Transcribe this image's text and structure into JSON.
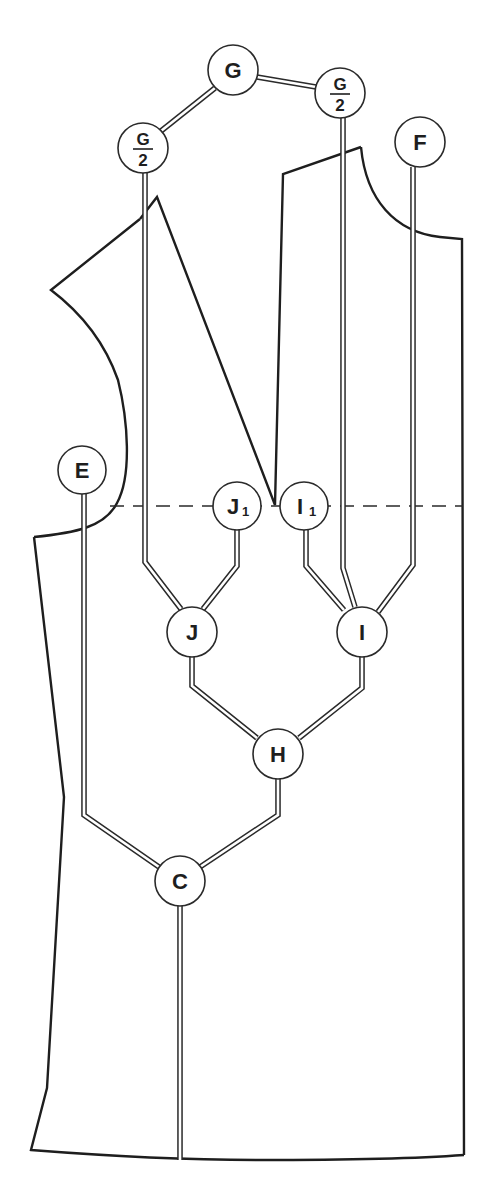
{
  "diagram": {
    "type": "garment-pattern-measurement-tree",
    "stroke_color": "#1e1e1e",
    "background": "#ffffff",
    "nodes": [
      {
        "id": "G",
        "label": "G",
        "sub": "",
        "fraction": false,
        "cx": 233,
        "cy": 70,
        "r": 25
      },
      {
        "id": "G2L",
        "label": "G",
        "sub": "2",
        "fraction": true,
        "cx": 143,
        "cy": 148,
        "r": 25
      },
      {
        "id": "G2R",
        "label": "G",
        "sub": "2",
        "fraction": true,
        "cx": 340,
        "cy": 93,
        "r": 25
      },
      {
        "id": "F",
        "label": "F",
        "sub": "",
        "fraction": false,
        "cx": 420,
        "cy": 142,
        "r": 25
      },
      {
        "id": "E",
        "label": "E",
        "sub": "",
        "fraction": false,
        "cx": 82,
        "cy": 470,
        "r": 24
      },
      {
        "id": "J1",
        "label": "J",
        "sub": "1",
        "fraction": false,
        "cx": 237,
        "cy": 506,
        "r": 24
      },
      {
        "id": "I1",
        "label": "I",
        "sub": "1",
        "fraction": false,
        "cx": 304,
        "cy": 506,
        "r": 24
      },
      {
        "id": "J",
        "label": "J",
        "sub": "",
        "fraction": false,
        "cx": 192,
        "cy": 632,
        "r": 25
      },
      {
        "id": "I",
        "label": "I",
        "sub": "",
        "fraction": false,
        "cx": 362,
        "cy": 632,
        "r": 25
      },
      {
        "id": "H",
        "label": "H",
        "sub": "",
        "fraction": false,
        "cx": 278,
        "cy": 754,
        "r": 25
      },
      {
        "id": "C",
        "label": "C",
        "sub": "",
        "fraction": false,
        "cx": 180,
        "cy": 881,
        "r": 25
      }
    ],
    "rails": [
      {
        "from": "G",
        "to": "G2L",
        "points": "215,88 161,131"
      },
      {
        "from": "G",
        "to": "G2R",
        "points": "257,77 316,87"
      },
      {
        "from": "G2L",
        "to": "J",
        "points": "145,173 145,562 181,609"
      },
      {
        "from": "J1",
        "to": "J",
        "points": "237,530 237,566 203,609"
      },
      {
        "from": "I1",
        "to": "I",
        "points": "306,530 306,566 344,610"
      },
      {
        "from": "G2R",
        "to": "I",
        "points": "343,118 343,568 355,607"
      },
      {
        "from": "F",
        "to": "I",
        "points": "413,167 413,565 378,612"
      },
      {
        "from": "J",
        "to": "H",
        "points": "192,657 192,686 257,738"
      },
      {
        "from": "I",
        "to": "H",
        "points": "362,657 362,688 299,738"
      },
      {
        "from": "H",
        "to": "C",
        "points": "278,779 278,815 200,867"
      },
      {
        "from": "E",
        "to": "C",
        "points": "84,494 84,815 159,867"
      },
      {
        "from": "C",
        "to": "hem",
        "points": "180,906 180,1160"
      }
    ],
    "outline_paths": [
      "M 34,537 L 37,536 C 70,532 100,526 115,505 C 135,482 130,420 125,380 C 112,340 85,310 51,290 L 140,218",
      "M 139,217 L 156,196 L 276,505 L 283,173 L 360,146",
      "M 360,146 C 370,200 400,230 440,238 L 461,242 L 463,1148",
      "M 34,537 L 34,537 L 62,797 L 47,1087 L 30,1150 C 120,1158 200,1160 260,1160 C 350,1160 410,1158 463,1156"
    ],
    "waist_line": {
      "x1": 110,
      "y1": 506,
      "x2": 463,
      "y2": 506
    }
  }
}
